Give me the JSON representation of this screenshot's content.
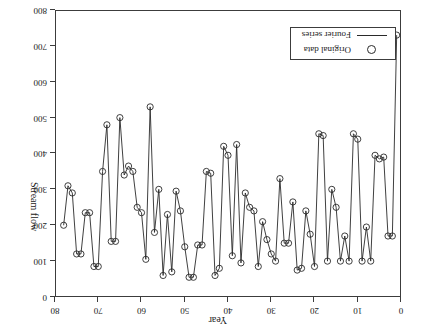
{
  "figure": {
    "orientation": "rotated-180",
    "background": "#ffffff",
    "ink_color": "#2a2a2a"
  },
  "legend": {
    "entries": [
      {
        "label": "Original data",
        "symbol": "circle-marker"
      },
      {
        "label": "Fourier series",
        "symbol": "solid-line"
      }
    ]
  },
  "chart_data": {
    "type": "line",
    "title": "",
    "subtitle": "",
    "xlabel": "Year",
    "ylabel": "Stream flow",
    "xlim": [
      0,
      80
    ],
    "ylim": [
      0,
      800
    ],
    "y_axis_inverted": true,
    "grid": false,
    "legend_position": "bottom-left",
    "xticks": [
      0,
      10,
      20,
      30,
      40,
      50,
      60,
      70,
      80
    ],
    "yticks": [
      0,
      100,
      200,
      300,
      400,
      500,
      600,
      700,
      800
    ],
    "xtick_labels": [
      "0",
      "10",
      "20",
      "30",
      "40",
      "50",
      "60",
      "70",
      "80"
    ],
    "ytick_labels": [
      "0",
      "100",
      "200",
      "300",
      "400",
      "500",
      "600",
      "700",
      "800"
    ],
    "series": [
      {
        "name": "Original data",
        "marker": "o",
        "linestyle": "none",
        "x": [
          1,
          2,
          3,
          4,
          5,
          6,
          7,
          8,
          9,
          10,
          11,
          12,
          13,
          14,
          15,
          16,
          17,
          18,
          19,
          20,
          21,
          22,
          23,
          24,
          25,
          26,
          27,
          28,
          29,
          30,
          31,
          32,
          33,
          34,
          35,
          36,
          37,
          38,
          39,
          40,
          41,
          42,
          43,
          44,
          45,
          46,
          47,
          48,
          49,
          50,
          51,
          52,
          53,
          54,
          55,
          56,
          57,
          58,
          59,
          60,
          61,
          62,
          63,
          64,
          65,
          66,
          67,
          68,
          69,
          70,
          71,
          72,
          73,
          74,
          75,
          76,
          77,
          78
        ],
        "values": [
          730,
          170,
          170,
          390,
          385,
          395,
          100,
          195,
          100,
          440,
          455,
          100,
          170,
          100,
          250,
          300,
          100,
          450,
          455,
          85,
          175,
          240,
          80,
          75,
          265,
          150,
          150,
          330,
          100,
          120,
          160,
          210,
          85,
          240,
          250,
          290,
          95,
          425,
          115,
          395,
          420,
          80,
          60,
          345,
          350,
          145,
          145,
          55,
          55,
          140,
          240,
          295,
          70,
          230,
          60,
          300,
          180,
          530,
          105,
          235,
          250,
          350,
          365,
          340,
          500,
          155,
          155,
          480,
          350,
          85,
          85,
          235,
          235,
          120,
          120,
          290,
          310,
          200
        ]
      },
      {
        "name": "Fourier series",
        "marker": "none",
        "linestyle": "-",
        "note": "smooth interpolating curve drawn through the original data points"
      }
    ]
  },
  "axes": {
    "x": {
      "title": "Year",
      "min": 0,
      "max": 80,
      "tick_step": 10
    },
    "y": {
      "title": "Stream flow",
      "min": 0,
      "max": 800,
      "tick_step": 100,
      "inverted": true
    }
  }
}
